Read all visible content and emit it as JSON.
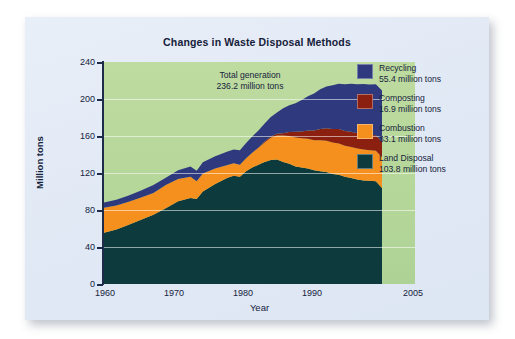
{
  "card": {
    "background_color": "#e4ebf6"
  },
  "chart_data": {
    "type": "area",
    "title": "Changes in Waste Disposal Methods",
    "xlabel": "Year",
    "ylabel": "Million tons",
    "xlim": [
      1960,
      2005
    ],
    "ylim": [
      0,
      240
    ],
    "grid": true,
    "stacked": true,
    "legend_position": "right",
    "panel_color": "#b6d79a",
    "annotation": {
      "line1": "Total generation",
      "line2": "236.2 million tons"
    },
    "y_ticks": [
      0,
      40,
      80,
      120,
      160,
      200,
      240
    ],
    "y_tick_labels": [
      "0",
      "40",
      "80",
      "120",
      "160",
      "200",
      "240"
    ],
    "x_ticks": [
      1960,
      1970,
      1980,
      1990,
      2005
    ],
    "x_tick_labels": [
      "1960",
      "1970",
      "1980",
      "1990",
      "2005"
    ],
    "x": [
      1960,
      1962,
      1964,
      1966,
      1968,
      1970,
      1972,
      1974,
      1975,
      1976,
      1978,
      1980,
      1981,
      1982,
      1983,
      1984,
      1985,
      1986,
      1987,
      1988,
      1989,
      1990,
      1991,
      1992,
      1993,
      1994,
      1995,
      1996,
      1997,
      1998,
      1999,
      2000,
      2001,
      2002,
      2003,
      2004,
      2005
    ],
    "series": [
      {
        "name": "Land Disposal",
        "color": "#0d3b3d",
        "value_label": "103.8 million tons",
        "value": 103.8,
        "values": [
          55.5,
          59.0,
          64.0,
          69.5,
          75.0,
          82.0,
          89.5,
          93.0,
          92.0,
          100.0,
          108.0,
          115.0,
          117.0,
          116.0,
          122.0,
          126.0,
          129.0,
          132.0,
          134.0,
          134.5,
          132.0,
          130.0,
          127.0,
          126.0,
          125.0,
          123.0,
          122.0,
          121.0,
          119.0,
          118.0,
          116.0,
          114.5,
          113.0,
          112.0,
          111.5,
          111.0,
          103.8
        ]
      },
      {
        "name": "Combustion",
        "color": "#f5901e",
        "value_label": "33.1 million tons",
        "value": 33.1,
        "values": [
          27.0,
          26.0,
          25.0,
          24.0,
          23.5,
          25.0,
          24.0,
          23.0,
          19.0,
          19.5,
          17.0,
          13.7,
          13.5,
          13.0,
          14.0,
          16.0,
          18.0,
          21.0,
          24.0,
          26.0,
          28.5,
          30.0,
          31.5,
          31.5,
          32.0,
          32.5,
          33.5,
          34.0,
          34.0,
          34.0,
          33.5,
          33.5,
          33.5,
          33.5,
          33.0,
          33.0,
          33.1
        ]
      },
      {
        "name": "Composting",
        "color": "#8b2010",
        "value_label": "16.9 million tons",
        "value": 16.9,
        "values": [
          0,
          0,
          0,
          0,
          0,
          0,
          0,
          0,
          0,
          0,
          0,
          0,
          0,
          0,
          0,
          0,
          0.5,
          1.0,
          1.5,
          2.0,
          2.5,
          4.2,
          6.0,
          7.5,
          9.0,
          10.5,
          12.0,
          13.5,
          14.5,
          15.5,
          16.0,
          16.5,
          16.5,
          16.7,
          16.8,
          16.9,
          16.9
        ]
      },
      {
        "name": "Recycling",
        "color": "#2e3a7d",
        "value_label": "55.4 million tons",
        "value": 55.4,
        "values": [
          5.6,
          6.0,
          6.8,
          7.5,
          8.5,
          8.0,
          9.5,
          11.0,
          11.5,
          12.0,
          13.0,
          14.5,
          15.0,
          15.5,
          16.5,
          17.5,
          18.5,
          19.5,
          21.0,
          23.0,
          27.0,
          29.0,
          31.0,
          34.0,
          37.0,
          40.0,
          43.0,
          45.0,
          47.5,
          49.0,
          50.5,
          52.0,
          53.0,
          54.0,
          54.5,
          55.0,
          55.4
        ]
      }
    ]
  },
  "legend": [
    {
      "name": "Recycling",
      "value_label": "55.4 million tons",
      "color": "#2e3a7d"
    },
    {
      "name": "Composting",
      "value_label": "16.9 million tons",
      "color": "#8b2010"
    },
    {
      "name": "Combustion",
      "value_label": "33.1 million tons",
      "color": "#f5901e"
    },
    {
      "name": "Land Disposal",
      "value_label": "103.8 million tons",
      "color": "#0d3b3d"
    }
  ]
}
